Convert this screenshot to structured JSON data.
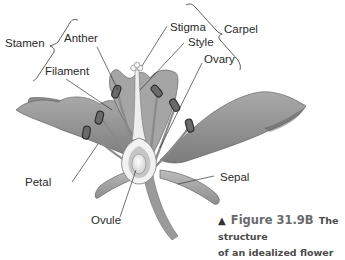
{
  "diagram": {
    "title": "The structure of an idealized flower",
    "labels": {
      "stamen": "Stamen",
      "anther": "Anther",
      "filament": "Filament",
      "stigma": "Stigma",
      "style": "Style",
      "ovary": "Ovary",
      "carpel": "Carpel",
      "petal": "Petal",
      "sepal": "Sepal",
      "ovule": "Ovule"
    },
    "caption": {
      "marker": "▲",
      "figure_number": "Figure 31.9B",
      "text_line1": "The structure",
      "text_line2": "of an idealized flower"
    }
  }
}
